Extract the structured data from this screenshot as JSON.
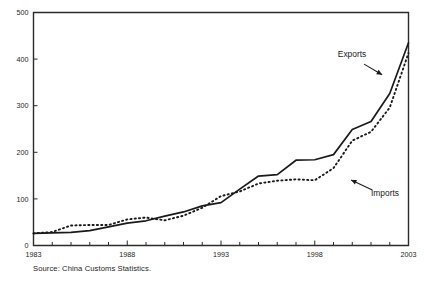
{
  "chart_data": {
    "type": "line",
    "title": "",
    "xlabel": "",
    "ylabel": "",
    "xlim": [
      1983,
      2003
    ],
    "ylim": [
      0,
      500
    ],
    "grid": false,
    "legend_position": "inline-annotations",
    "x": [
      1983,
      1984,
      1985,
      1986,
      1987,
      1988,
      1989,
      1990,
      1991,
      1992,
      1993,
      1994,
      1995,
      1996,
      1997,
      1998,
      1999,
      2000,
      2001,
      2002,
      2003
    ],
    "xticklabels": [
      "1983",
      "1988",
      "1993",
      "1998",
      "2003"
    ],
    "xtickvalues": [
      1983,
      1988,
      1993,
      1998,
      2003
    ],
    "yticklabels": [
      "0",
      "100",
      "200",
      "300",
      "400",
      "500"
    ],
    "ytickvalues": [
      0,
      100,
      200,
      300,
      400,
      500
    ],
    "series": [
      {
        "name": "Exports",
        "style": "solid",
        "values": [
          26,
          27,
          28,
          32,
          40,
          48,
          53,
          63,
          72,
          85,
          92,
          121,
          149,
          152,
          183,
          184,
          195,
          249,
          266,
          326,
          435
        ]
      },
      {
        "name": "Imports",
        "style": "dotted",
        "values": [
          26,
          29,
          43,
          44,
          44,
          56,
          60,
          54,
          64,
          81,
          106,
          116,
          133,
          139,
          142,
          140,
          166,
          225,
          244,
          296,
          413
        ]
      }
    ],
    "annotations": [
      {
        "label": "Exports",
        "target_series": "Exports",
        "target_x": 2001.6,
        "target_y": 300
      },
      {
        "label": "Imports",
        "target_series": "Imports",
        "target_x": 1999.1,
        "target_y": 170
      }
    ]
  },
  "source": {
    "note": "Source: China Customs Statistics."
  }
}
